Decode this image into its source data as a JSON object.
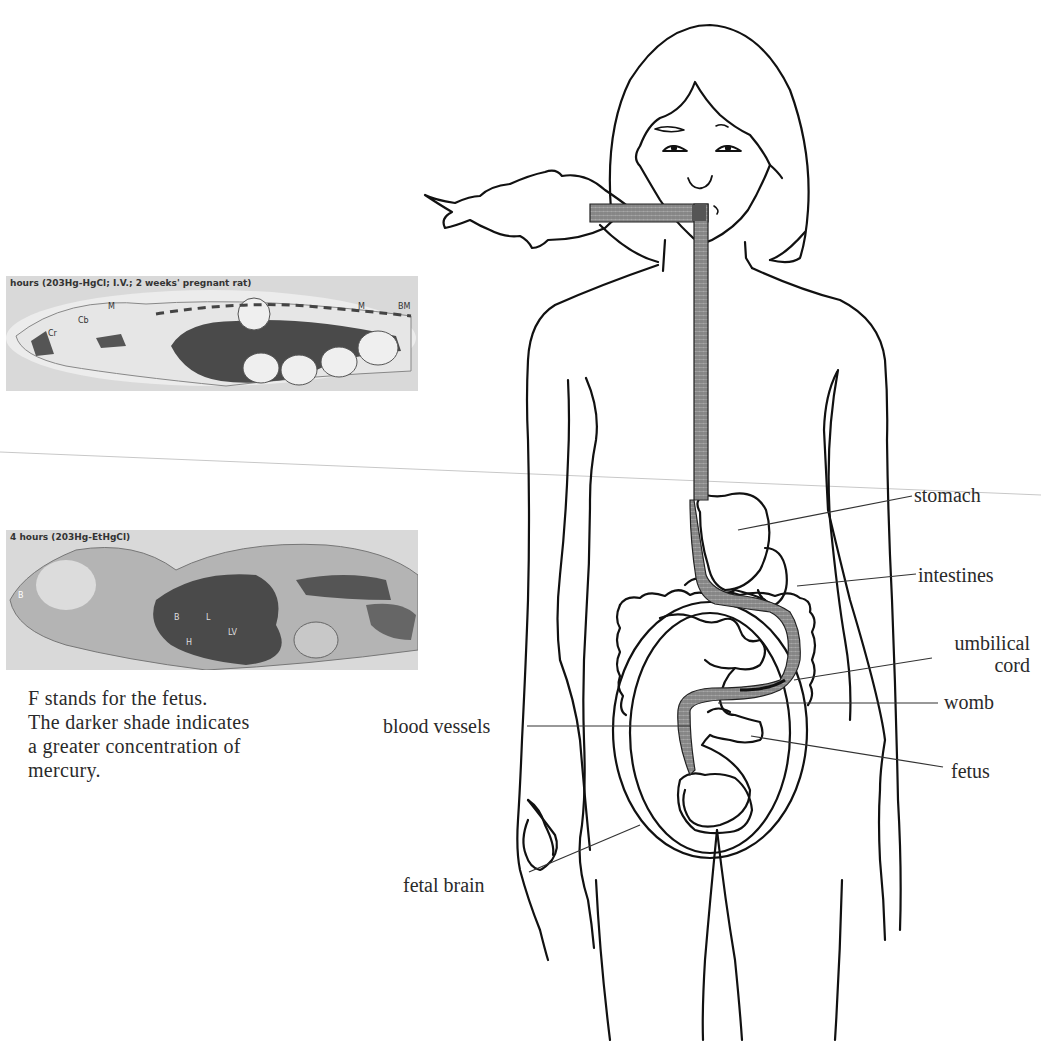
{
  "figure": {
    "photos": [
      {
        "id": "photo-top",
        "caption": "hours (203Hg-HgCl; I.V.; 2 weeks' pregnant rat)",
        "organ_markers": [
          "M",
          "Cb",
          "Cr",
          "M",
          "BM",
          "F",
          "F",
          "F",
          "F"
        ]
      },
      {
        "id": "photo-bottom",
        "caption": "4 hours (203Hg-EtHgCl)",
        "organ_markers": [
          "B",
          "B",
          "H",
          "L",
          "LV"
        ]
      }
    ],
    "caption_lines": [
      "F stands for the fetus.",
      "The darker shade indicates",
      "a greater concentration of",
      "mercury."
    ],
    "labels": {
      "stomach": "stomach",
      "intestines": "intestines",
      "umbilical_cord_line1": "umbilical",
      "umbilical_cord_line2": "cord",
      "womb": "womb",
      "fetus": "fetus",
      "blood_vessels": "blood vessels",
      "fetal_brain": "fetal brain"
    },
    "colors": {
      "line": "#111111",
      "pathway_fill": "#8c8c8c",
      "photo_bg": "#d9d9d9",
      "photo_dark": "#4a4a4a"
    }
  }
}
